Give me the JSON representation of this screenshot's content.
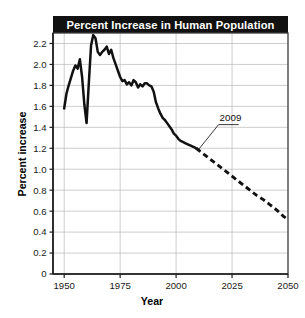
{
  "chart_data": {
    "type": "line",
    "title": "Percent Increase in Human Population",
    "xlabel": "Year",
    "ylabel": "Percent increase",
    "xlim": [
      1945,
      2050
    ],
    "ylim": [
      0,
      2.3
    ],
    "grid": true,
    "legend": false,
    "xticks": [
      1950,
      1975,
      2000,
      2025,
      2050
    ],
    "xtick_labels": [
      "1950",
      "1975",
      "2000",
      "2025",
      "2050"
    ],
    "yticks": [
      0,
      0.2,
      0.4,
      0.6,
      0.8,
      1.0,
      1.2,
      1.4,
      1.6,
      1.8,
      2.0,
      2.2
    ],
    "ytick_labels": [
      "0",
      "0.2",
      "0.4",
      "0.6",
      "0.8",
      "1.0",
      "1.2",
      "1.4",
      "1.6",
      "1.8",
      "2.0",
      "2.2"
    ],
    "annotations": [
      {
        "text": "2009",
        "x": 2009,
        "y": 1.2,
        "label_x": 2019,
        "label_y": 1.44,
        "note": "transition from observed data to projection"
      }
    ],
    "series": [
      {
        "name": "Observed",
        "style": "solid",
        "x": [
          1950,
          1951,
          1952,
          1953,
          1954,
          1955,
          1956,
          1957,
          1958,
          1959,
          1960,
          1961,
          1962,
          1963,
          1964,
          1965,
          1966,
          1967,
          1968,
          1969,
          1970,
          1971,
          1972,
          1973,
          1974,
          1975,
          1976,
          1977,
          1978,
          1979,
          1980,
          1981,
          1982,
          1983,
          1984,
          1985,
          1986,
          1987,
          1988,
          1989,
          1990,
          1991,
          1992,
          1993,
          1994,
          1995,
          1996,
          1997,
          1998,
          1999,
          2000,
          2001,
          2002,
          2003,
          2004,
          2005,
          2006,
          2007,
          2008,
          2009
        ],
        "y": [
          1.58,
          1.72,
          1.8,
          1.87,
          1.94,
          1.99,
          1.96,
          2.05,
          1.88,
          1.62,
          1.44,
          1.82,
          2.18,
          2.28,
          2.25,
          2.12,
          2.09,
          2.12,
          2.14,
          2.17,
          2.1,
          2.14,
          2.06,
          2.0,
          1.94,
          1.88,
          1.84,
          1.85,
          1.81,
          1.83,
          1.8,
          1.85,
          1.83,
          1.78,
          1.81,
          1.79,
          1.82,
          1.82,
          1.8,
          1.79,
          1.74,
          1.64,
          1.58,
          1.53,
          1.49,
          1.47,
          1.44,
          1.41,
          1.38,
          1.34,
          1.32,
          1.29,
          1.27,
          1.26,
          1.25,
          1.24,
          1.23,
          1.22,
          1.21,
          1.2
        ]
      },
      {
        "name": "Projected",
        "style": "dashed",
        "x": [
          2009,
          2012,
          2015,
          2018,
          2021,
          2024,
          2027,
          2030,
          2033,
          2036,
          2039,
          2042,
          2045,
          2048,
          2050
        ],
        "y": [
          1.2,
          1.15,
          1.1,
          1.05,
          1.0,
          0.95,
          0.9,
          0.85,
          0.8,
          0.75,
          0.71,
          0.66,
          0.61,
          0.55,
          0.52
        ]
      }
    ]
  }
}
